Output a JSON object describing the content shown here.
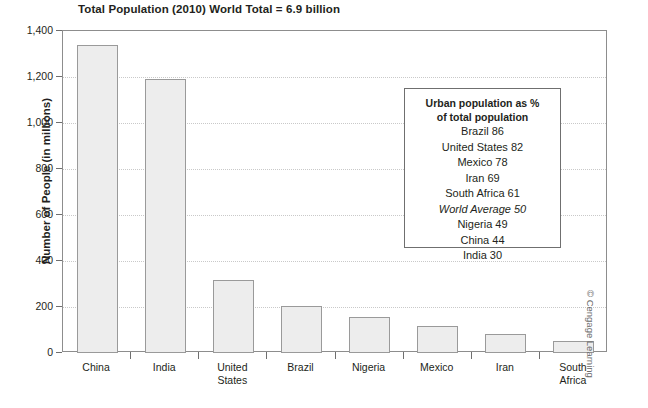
{
  "chart_data": {
    "type": "bar",
    "title": "Total Population (2010) World Total = 6.9 billion",
    "xlabel": "",
    "ylabel": "Number of People (in millions)",
    "ylim": [
      0,
      1400
    ],
    "yticks": [
      "0",
      "200",
      "400",
      "600",
      "800",
      "1,000",
      "1,200",
      "1,400"
    ],
    "ytick_values": [
      0,
      200,
      400,
      600,
      800,
      1000,
      1200,
      1400
    ],
    "grid": true,
    "legend_position": "inside-right",
    "categories": [
      "China",
      "India",
      "United States",
      "Brazil",
      "Nigeria",
      "Mexico",
      "Iran",
      "South Africa"
    ],
    "values": [
      1340,
      1190,
      317,
      204,
      158,
      117,
      84,
      52
    ]
  },
  "note_box": {
    "heading_line1": "Urban population as %",
    "heading_line2": "of total population",
    "rows": [
      {
        "text": "Brazil 86",
        "italic": false
      },
      {
        "text": "United States 82",
        "italic": false
      },
      {
        "text": "Mexico 78",
        "italic": false
      },
      {
        "text": "Iran 69",
        "italic": false
      },
      {
        "text": "South Africa 61",
        "italic": false
      },
      {
        "text": "World Average 50",
        "italic": true
      },
      {
        "text": "Nigeria 49",
        "italic": false
      },
      {
        "text": "China 44",
        "italic": false
      },
      {
        "text": "India 30",
        "italic": false
      }
    ]
  },
  "credit": "© Cengage Learning"
}
